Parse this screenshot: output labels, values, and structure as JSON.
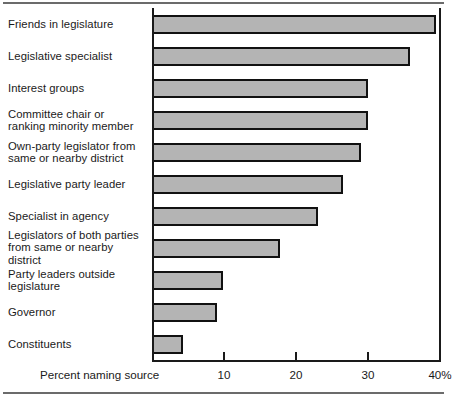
{
  "chart_data": {
    "type": "bar",
    "orientation": "horizontal",
    "title": "",
    "xlabel": "Percent naming source",
    "ylabel": "",
    "xlim": [
      0,
      40
    ],
    "grid": false,
    "legend": null,
    "xticks": [
      10,
      20,
      30,
      40
    ],
    "xtick_labels": [
      "10",
      "20",
      "30",
      "40%"
    ],
    "categories": [
      "Friends in legislature",
      "Legislative specialist",
      "Interest groups",
      "Committee chair or\nranking minority member",
      "Own-party legislator from\nsame or nearby district",
      "Legislative party leader",
      "Specialist in agency",
      "Legislators of both parties\nfrom same or nearby district",
      "Party leaders outside\nlegislature",
      "Governor",
      "Constituents"
    ],
    "values": [
      39.5,
      35.8,
      30.0,
      30.0,
      29.0,
      26.5,
      23.0,
      17.8,
      9.8,
      9.0,
      4.3
    ],
    "bar_fill_color": "#b4b4b4",
    "bar_edge_color": "#111111",
    "axis_color": "#1a1a1a"
  }
}
